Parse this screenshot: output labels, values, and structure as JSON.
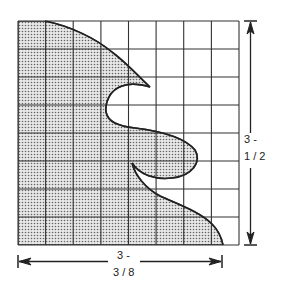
{
  "diagram": {
    "type": "pattern-grid",
    "grid": {
      "columns": 8,
      "rows": 8
    },
    "colors": {
      "line": "#333333",
      "fill_dots": "#555555",
      "background": "#ffffff"
    },
    "dimensions": {
      "height": {
        "line1": "3 -",
        "line2": "1 / 2"
      },
      "width": {
        "line1": "3 -",
        "line2": "3 / 8"
      }
    }
  }
}
